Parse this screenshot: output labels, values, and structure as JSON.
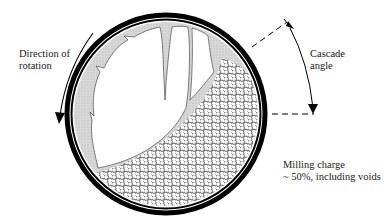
{
  "diagram": {
    "labels": {
      "rotation_line1": "Direction of",
      "rotation_line2": "rotation",
      "cascade_line1": "Cascade",
      "cascade_line2": "angle",
      "charge_line1": "Milling charge",
      "charge_line2": "~ 50%, including voids"
    },
    "colors": {
      "shell": "#000000",
      "liner_fill": "#d4d4d4",
      "background": "#ffffff",
      "ball_stroke": "#222222"
    },
    "geometry": {
      "center": [
        166,
        114
      ],
      "outer_radius": 101,
      "charge_fill_percent": 50
    }
  }
}
